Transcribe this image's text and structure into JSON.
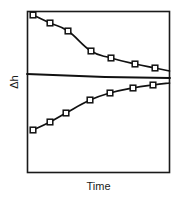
{
  "chart_data": {
    "type": "line",
    "title": "",
    "xlabel": "Time",
    "ylabel": "Δh",
    "grid": false,
    "legend": null,
    "axis_ticks": {
      "x": [],
      "y": []
    },
    "xlim": [
      0,
      100
    ],
    "ylim": [
      0,
      100
    ],
    "frame": {
      "left": 27,
      "top": 11,
      "right": 170,
      "bottom": 173
    },
    "marker": "open-square",
    "series": [
      {
        "name": "upper-curve",
        "marker": "open-square",
        "description": "decaying curve approaching plateau from above",
        "points": [
          {
            "x": 4,
            "y": 97
          },
          {
            "x": 16,
            "y": 88
          },
          {
            "x": 29,
            "y": 78
          },
          {
            "x": 45,
            "y": 65
          },
          {
            "x": 59,
            "y": 59
          },
          {
            "x": 76,
            "y": 53
          },
          {
            "x": 90,
            "y": 50
          }
        ],
        "pixel_points": [
          [
            33,
            15
          ],
          [
            50,
            23
          ],
          [
            68,
            31
          ],
          [
            91,
            51
          ],
          [
            111,
            58
          ],
          [
            135,
            64
          ],
          [
            155,
            68
          ]
        ]
      },
      {
        "name": "baseline",
        "marker": "none",
        "description": "near-horizontal reference line, slightly descending",
        "points": [
          {
            "x": 0,
            "y": 42
          },
          {
            "x": 100,
            "y": 39
          }
        ],
        "pixel_points": [
          [
            27,
            74
          ],
          [
            170,
            78
          ]
        ]
      },
      {
        "name": "lower-curve",
        "marker": "open-square",
        "description": "rising curve approaching plateau from below",
        "points": [
          {
            "x": 4,
            "y": 5
          },
          {
            "x": 16,
            "y": 12
          },
          {
            "x": 27,
            "y": 19
          },
          {
            "x": 44,
            "y": 27
          },
          {
            "x": 58,
            "y": 32
          },
          {
            "x": 74,
            "y": 35
          },
          {
            "x": 88,
            "y": 37
          }
        ],
        "pixel_points": [
          [
            33,
            130
          ],
          [
            50,
            122
          ],
          [
            66,
            113
          ],
          [
            90,
            100
          ],
          [
            110,
            93
          ],
          [
            133,
            88
          ],
          [
            153,
            85
          ]
        ]
      }
    ]
  },
  "figure": {
    "y_axis_label": "Δh",
    "x_axis_label": "Time",
    "frame_color": "#1a1a1a",
    "line_color": "#111111",
    "marker_fill": "#ffffff",
    "background": "#ffffff"
  }
}
